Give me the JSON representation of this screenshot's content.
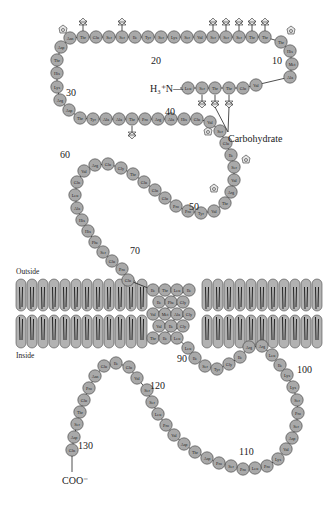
{
  "figure": {
    "labels": {
      "outside": "Outside",
      "inside": "Inside",
      "n_terminus": "H₃⁺N—",
      "c_terminus": "COO⁻",
      "carbohydrate": "Carbohydrate"
    },
    "number_labels": [
      {
        "text": "10",
        "x": 272,
        "y": 64
      },
      {
        "text": "20",
        "x": 151,
        "y": 64
      },
      {
        "text": "30",
        "x": 66,
        "y": 96
      },
      {
        "text": "40",
        "x": 165,
        "y": 115
      },
      {
        "text": "50",
        "x": 189,
        "y": 210
      },
      {
        "text": "60",
        "x": 60,
        "y": 158
      },
      {
        "text": "70",
        "x": 130,
        "y": 254
      },
      {
        "text": "90",
        "x": 177,
        "y": 362
      },
      {
        "text": "100",
        "x": 297,
        "y": 373
      },
      {
        "text": "110",
        "x": 239,
        "y": 455
      },
      {
        "text": "120",
        "x": 150,
        "y": 389
      },
      {
        "text": "130",
        "x": 78,
        "y": 449
      }
    ],
    "colors": {
      "residue_fill": "#a9a9a9",
      "residue_stroke": "#3a3a3a",
      "lipid_head": "#b2b2b2",
      "background": "#ffffff"
    }
  },
  "residues": [
    {
      "n": 1,
      "aa": "Leu",
      "x": 188,
      "y": 88
    },
    {
      "n": 2,
      "aa": "Ser",
      "x": 202,
      "y": 88
    },
    {
      "n": 3,
      "aa": "Thr",
      "x": 215,
      "y": 88
    },
    {
      "n": 4,
      "aa": "Thr",
      "x": 229,
      "y": 88
    },
    {
      "n": 5,
      "aa": "Glu",
      "x": 243,
      "y": 88
    },
    {
      "n": 6,
      "aa": "Val",
      "x": 256,
      "y": 85
    },
    {
      "n": 7,
      "aa": "Ala",
      "x": 290,
      "y": 77
    },
    {
      "n": 8,
      "aa": "Met",
      "x": 292,
      "y": 64
    },
    {
      "n": 9,
      "aa": "His",
      "x": 290,
      "y": 51
    },
    {
      "n": 10,
      "aa": "Thr",
      "x": 281,
      "y": 42
    },
    {
      "n": 11,
      "aa": "Thr",
      "x": 265,
      "y": 37
    },
    {
      "n": 12,
      "aa": "Thr",
      "x": 252,
      "y": 37
    },
    {
      "n": 13,
      "aa": "Ser",
      "x": 239,
      "y": 37
    },
    {
      "n": 14,
      "aa": "Ser",
      "x": 226,
      "y": 37
    },
    {
      "n": 15,
      "aa": "Ser",
      "x": 213,
      "y": 37
    },
    {
      "n": 16,
      "aa": "Val",
      "x": 200,
      "y": 37
    },
    {
      "n": 17,
      "aa": "Ser",
      "x": 187,
      "y": 37
    },
    {
      "n": 18,
      "aa": "Lys",
      "x": 174,
      "y": 37
    },
    {
      "n": 19,
      "aa": "Ser",
      "x": 161,
      "y": 37
    },
    {
      "n": 20,
      "aa": "Tyr",
      "x": 148,
      "y": 37
    },
    {
      "n": 21,
      "aa": "Ile",
      "x": 135,
      "y": 37
    },
    {
      "n": 22,
      "aa": "Ser",
      "x": 122,
      "y": 37
    },
    {
      "n": 23,
      "aa": "Ser",
      "x": 109,
      "y": 37
    },
    {
      "n": 24,
      "aa": "Glu",
      "x": 96,
      "y": 37
    },
    {
      "n": 25,
      "aa": "Thr",
      "x": 83,
      "y": 37
    },
    {
      "n": 26,
      "aa": "Asn",
      "x": 70,
      "y": 38
    },
    {
      "n": 27,
      "aa": "Asp",
      "x": 61,
      "y": 47
    },
    {
      "n": 28,
      "aa": "Thr",
      "x": 57,
      "y": 60
    },
    {
      "n": 29,
      "aa": "His",
      "x": 57,
      "y": 73
    },
    {
      "n": 30,
      "aa": "Lys",
      "x": 57,
      "y": 87
    },
    {
      "n": 31,
      "aa": "Arg",
      "x": 60,
      "y": 100
    },
    {
      "n": 32,
      "aa": "Asp",
      "x": 69,
      "y": 110
    },
    {
      "n": 33,
      "aa": "Thr",
      "x": 80,
      "y": 118
    },
    {
      "n": 34,
      "aa": "Tyr",
      "x": 93,
      "y": 119
    },
    {
      "n": 35,
      "aa": "Ala",
      "x": 106,
      "y": 119
    },
    {
      "n": 36,
      "aa": "Ala",
      "x": 119,
      "y": 119
    },
    {
      "n": 37,
      "aa": "Thr",
      "x": 132,
      "y": 119
    },
    {
      "n": 38,
      "aa": "Pro",
      "x": 145,
      "y": 119
    },
    {
      "n": 39,
      "aa": "Arg",
      "x": 158,
      "y": 119
    },
    {
      "n": 40,
      "aa": "Ala",
      "x": 171,
      "y": 119
    },
    {
      "n": 41,
      "aa": "His",
      "x": 184,
      "y": 119
    },
    {
      "n": 42,
      "aa": "Glu",
      "x": 197,
      "y": 119
    },
    {
      "n": 43,
      "aa": "Val",
      "x": 210,
      "y": 122
    },
    {
      "n": 44,
      "aa": "Ser",
      "x": 220,
      "y": 131
    },
    {
      "n": 45,
      "aa": "Glu",
      "x": 226,
      "y": 143
    },
    {
      "n": 46,
      "aa": "Ile",
      "x": 231,
      "y": 155
    },
    {
      "n": 47,
      "aa": "Ser",
      "x": 234,
      "y": 167
    },
    {
      "n": 48,
      "aa": "Val",
      "x": 234,
      "y": 180
    },
    {
      "n": 49,
      "aa": "Arg",
      "x": 231,
      "y": 192
    },
    {
      "n": 50,
      "aa": "Thr",
      "x": 225,
      "y": 203
    },
    {
      "n": 51,
      "aa": "Val",
      "x": 214,
      "y": 211
    },
    {
      "n": 52,
      "aa": "Tyr",
      "x": 201,
      "y": 213
    },
    {
      "n": 53,
      "aa": "Pro",
      "x": 188,
      "y": 211
    },
    {
      "n": 54,
      "aa": "Pro",
      "x": 176,
      "y": 206
    },
    {
      "n": 55,
      "aa": "Glu",
      "x": 165,
      "y": 198
    },
    {
      "n": 56,
      "aa": "Glu",
      "x": 155,
      "y": 190
    },
    {
      "n": 57,
      "aa": "Glu",
      "x": 144,
      "y": 182
    },
    {
      "n": 58,
      "aa": "Thr",
      "x": 133,
      "y": 174
    },
    {
      "n": 59,
      "aa": "Gly",
      "x": 121,
      "y": 168
    },
    {
      "n": 60,
      "aa": "Glu",
      "x": 108,
      "y": 164
    },
    {
      "n": 61,
      "aa": "Arg",
      "x": 95,
      "y": 165
    },
    {
      "n": 62,
      "aa": "Val",
      "x": 84,
      "y": 171
    },
    {
      "n": 63,
      "aa": "Gln",
      "x": 77,
      "y": 182
    },
    {
      "n": 64,
      "aa": "Leu",
      "x": 75,
      "y": 195
    },
    {
      "n": 65,
      "aa": "Ala",
      "x": 77,
      "y": 208
    },
    {
      "n": 66,
      "aa": "His",
      "x": 82,
      "y": 220
    },
    {
      "n": 67,
      "aa": "His",
      "x": 88,
      "y": 231
    },
    {
      "n": 68,
      "aa": "Phe",
      "x": 95,
      "y": 242
    },
    {
      "n": 69,
      "aa": "Ser",
      "x": 103,
      "y": 252
    },
    {
      "n": 70,
      "aa": "Glu",
      "x": 112,
      "y": 261
    },
    {
      "n": 71,
      "aa": "Pro",
      "x": 122,
      "y": 269
    },
    {
      "n": 72,
      "aa": "Glu",
      "x": 128,
      "y": 280
    },
    {
      "n": 73,
      "aa": "Ile",
      "x": 153,
      "y": 290
    },
    {
      "n": 74,
      "aa": "Thr",
      "x": 165,
      "y": 290
    },
    {
      "n": 75,
      "aa": "Leu",
      "x": 177,
      "y": 290
    },
    {
      "n": 76,
      "aa": "Ile",
      "x": 189,
      "y": 290
    },
    {
      "n": 77,
      "aa": "Ile",
      "x": 159,
      "y": 302
    },
    {
      "n": 78,
      "aa": "Phe",
      "x": 171,
      "y": 302
    },
    {
      "n": 79,
      "aa": "Gly",
      "x": 183,
      "y": 302
    },
    {
      "n": 80,
      "aa": "Val",
      "x": 153,
      "y": 314
    },
    {
      "n": 81,
      "aa": "Met",
      "x": 165,
      "y": 314
    },
    {
      "n": 82,
      "aa": "Ala",
      "x": 177,
      "y": 314
    },
    {
      "n": 83,
      "aa": "Gly",
      "x": 189,
      "y": 314
    },
    {
      "n": 84,
      "aa": "Val",
      "x": 159,
      "y": 326
    },
    {
      "n": 85,
      "aa": "Ile",
      "x": 171,
      "y": 326
    },
    {
      "n": 86,
      "aa": "Gly",
      "x": 183,
      "y": 326
    },
    {
      "n": 87,
      "aa": "Thr",
      "x": 153,
      "y": 338
    },
    {
      "n": 88,
      "aa": "Ile",
      "x": 165,
      "y": 338
    },
    {
      "n": 89,
      "aa": "Leu",
      "x": 177,
      "y": 338
    },
    {
      "n": 90,
      "aa": "Leu",
      "x": 188,
      "y": 348
    },
    {
      "n": 91,
      "aa": "Ile",
      "x": 195,
      "y": 358
    },
    {
      "n": 92,
      "aa": "Ser",
      "x": 205,
      "y": 366
    },
    {
      "n": 93,
      "aa": "Tyr",
      "x": 217,
      "y": 369
    },
    {
      "n": 94,
      "aa": "Gly",
      "x": 229,
      "y": 364
    },
    {
      "n": 95,
      "aa": "Ile",
      "x": 240,
      "y": 357
    },
    {
      "n": 96,
      "aa": "Arg",
      "x": 249,
      "y": 347
    },
    {
      "n": 97,
      "aa": "Arg",
      "x": 262,
      "y": 346
    },
    {
      "n": 98,
      "aa": "Leu",
      "x": 272,
      "y": 355
    },
    {
      "n": 99,
      "aa": "Ile",
      "x": 280,
      "y": 365
    },
    {
      "n": 100,
      "aa": "Lys",
      "x": 287,
      "y": 375
    },
    {
      "n": 101,
      "aa": "Lys",
      "x": 293,
      "y": 387
    },
    {
      "n": 102,
      "aa": "Ser",
      "x": 297,
      "y": 400
    },
    {
      "n": 103,
      "aa": "Pro",
      "x": 298,
      "y": 413
    },
    {
      "n": 104,
      "aa": "Ser",
      "x": 296,
      "y": 426
    },
    {
      "n": 105,
      "aa": "Asp",
      "x": 292,
      "y": 438
    },
    {
      "n": 106,
      "aa": "Val",
      "x": 286,
      "y": 449
    },
    {
      "n": 107,
      "aa": "Lys",
      "x": 278,
      "y": 459
    },
    {
      "n": 108,
      "aa": "Pro",
      "x": 267,
      "y": 466
    },
    {
      "n": 109,
      "aa": "Leu",
      "x": 255,
      "y": 468
    },
    {
      "n": 110,
      "aa": "Pro",
      "x": 243,
      "y": 469
    },
    {
      "n": 111,
      "aa": "Ser",
      "x": 231,
      "y": 466
    },
    {
      "n": 112,
      "aa": "Pro",
      "x": 219,
      "y": 463
    },
    {
      "n": 113,
      "aa": "Asp",
      "x": 207,
      "y": 458
    },
    {
      "n": 114,
      "aa": "Thr",
      "x": 195,
      "y": 452
    },
    {
      "n": 115,
      "aa": "Asp",
      "x": 184,
      "y": 444
    },
    {
      "n": 116,
      "aa": "Val",
      "x": 174,
      "y": 435
    },
    {
      "n": 117,
      "aa": "Pro",
      "x": 166,
      "y": 425
    },
    {
      "n": 118,
      "aa": "Leu",
      "x": 158,
      "y": 414
    },
    {
      "n": 119,
      "aa": "Ser",
      "x": 152,
      "y": 402
    },
    {
      "n": 120,
      "aa": "Ser",
      "x": 147,
      "y": 390
    },
    {
      "n": 121,
      "aa": "Val",
      "x": 137,
      "y": 378
    },
    {
      "n": 122,
      "aa": "Glu",
      "x": 129,
      "y": 367
    },
    {
      "n": 123,
      "aa": "Ile",
      "x": 116,
      "y": 363
    },
    {
      "n": 124,
      "aa": "Glu",
      "x": 104,
      "y": 366
    },
    {
      "n": 125,
      "aa": "Asn",
      "x": 95,
      "y": 376
    },
    {
      "n": 126,
      "aa": "Pro",
      "x": 89,
      "y": 388
    },
    {
      "n": 127,
      "aa": "Glu",
      "x": 84,
      "y": 400
    },
    {
      "n": 128,
      "aa": "Thr",
      "x": 80,
      "y": 412
    },
    {
      "n": 129,
      "aa": "Ser",
      "x": 77,
      "y": 424
    },
    {
      "n": 130,
      "aa": "Asp",
      "x": 74,
      "y": 437
    },
    {
      "n": 131,
      "aa": "Gln",
      "x": 72,
      "y": 450
    }
  ],
  "o_glycans": [
    {
      "x": 83,
      "y": 25,
      "dir": "up"
    },
    {
      "x": 122,
      "y": 25,
      "dir": "up"
    },
    {
      "x": 213,
      "y": 25,
      "dir": "up"
    },
    {
      "x": 226,
      "y": 25,
      "dir": "up"
    },
    {
      "x": 239,
      "y": 25,
      "dir": "up"
    },
    {
      "x": 252,
      "y": 25,
      "dir": "up"
    },
    {
      "x": 265,
      "y": 25,
      "dir": "up"
    },
    {
      "x": 202,
      "y": 101,
      "dir": "down"
    },
    {
      "x": 215,
      "y": 101,
      "dir": "down"
    },
    {
      "x": 229,
      "y": 101,
      "dir": "down"
    },
    {
      "x": 132,
      "y": 132,
      "dir": "down"
    }
  ],
  "n_glycans": [
    {
      "x": 63,
      "y": 30
    },
    {
      "x": 291,
      "y": 31
    },
    {
      "x": 208,
      "y": 132
    },
    {
      "x": 246,
      "y": 160
    },
    {
      "x": 214,
      "y": 189
    }
  ],
  "membrane": {
    "outer_top": 279,
    "middle": 313,
    "inner_bottom": 348,
    "left_x_start": 16,
    "left_x_end": 142,
    "right_x_start": 202,
    "right_x_end": 320,
    "lipid_spacing": 11
  }
}
